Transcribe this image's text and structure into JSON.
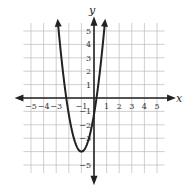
{
  "chart_data": {
    "type": "line",
    "title": "",
    "xlabel": "x",
    "ylabel": "y",
    "xlim": [
      -5.5,
      5.5
    ],
    "ylim": [
      -5.5,
      5.5
    ],
    "grid": true,
    "x_ticks": [
      "−5",
      "−4",
      "−3",
      "−1",
      "1",
      "2",
      "3",
      "4",
      "5"
    ],
    "x_tick_values": [
      -5,
      -4,
      -3,
      -1,
      1,
      2,
      3,
      4,
      5
    ],
    "y_ticks": [
      "5",
      "4",
      "3",
      "2",
      "1",
      "−1",
      "−2",
      "−3",
      "−5"
    ],
    "y_tick_values": [
      5,
      4,
      3,
      2,
      1,
      -1,
      -2,
      -3,
      -5
    ],
    "series": [
      {
        "name": "parabola",
        "description": "upward-opening parabola with arrowheads on both branches",
        "vertex": [
          -1,
          -4
        ],
        "x_intercepts": [
          -2.2,
          0.2
        ],
        "y_intercept": -1.2,
        "x": [
          -2.4,
          -2.2,
          -2.0,
          -1.8,
          -1.6,
          -1.4,
          -1.2,
          -1.0,
          -0.8,
          -0.6,
          -0.4,
          -0.2,
          0.0,
          0.2,
          0.4
        ],
        "y": [
          1.49,
          0.03,
          -1.2,
          -2.21,
          -2.99,
          -3.55,
          -3.89,
          -4.0,
          -3.89,
          -3.55,
          -2.99,
          -2.21,
          -1.2,
          0.03,
          1.49
        ]
      }
    ],
    "colors": {
      "curve": "#222222",
      "axis": "#222222",
      "grid": "#bbbbbb"
    }
  }
}
